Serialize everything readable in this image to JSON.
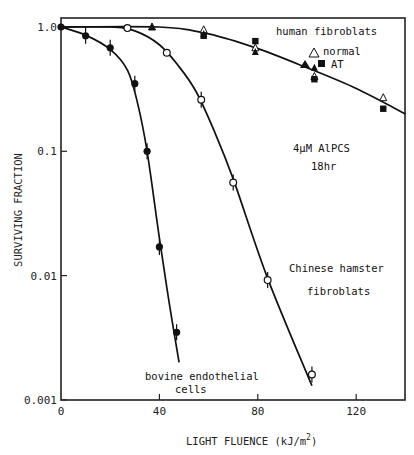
{
  "chart_data": {
    "type": "scatter",
    "title": "",
    "xlabel": "LIGHT FLUENCE (kJ/m2)",
    "xlabel_parts": {
      "main": "LIGHT FLUENCE (kJ/m",
      "sup": "2",
      "end": ")"
    },
    "ylabel": "SURVIVING FRACTION",
    "xlim": [
      0,
      140
    ],
    "ylim": [
      0.001,
      1.15
    ],
    "yscale": "log",
    "grid": false,
    "x_ticks": [
      0,
      40,
      80,
      120
    ],
    "x_tick_labels": [
      "0",
      "40",
      "80",
      "120"
    ],
    "y_ticks": [
      1.0,
      0.1,
      0.01,
      0.001
    ],
    "y_tick_labels": [
      "1.0",
      "0.1",
      "0.01",
      "0.001"
    ],
    "annotations": {
      "human_title": "human fibroblats",
      "normal_label": "normal",
      "at_label": "AT",
      "treatment_line1": "4μM AlPCS",
      "treatment_line2": "18hr",
      "hamster_line1": "Chinese hamster",
      "hamster_line2": "fibroblats",
      "bovine_line1": "bovine endothelial",
      "bovine_line2": "cells"
    },
    "series": [
      {
        "name": "bovine endothelial cells",
        "marker": "filled-circle",
        "x": [
          0,
          10,
          20,
          30,
          35,
          40,
          47
        ],
        "y": [
          1.0,
          0.85,
          0.68,
          0.35,
          0.1,
          0.017,
          0.0035
        ],
        "curve_x": [
          0,
          10,
          20,
          27,
          31,
          35,
          40,
          44,
          48
        ],
        "curve_y": [
          1.0,
          0.86,
          0.66,
          0.45,
          0.25,
          0.1,
          0.02,
          0.006,
          0.002
        ]
      },
      {
        "name": "Chinese hamster fibroblats",
        "marker": "open-circle",
        "x": [
          27,
          43,
          57,
          70,
          84,
          102
        ],
        "y": [
          0.98,
          0.62,
          0.26,
          0.056,
          0.0092,
          0.0016
        ],
        "curve_x": [
          0,
          20,
          30,
          40,
          48,
          55,
          62,
          70,
          84,
          102
        ],
        "curve_y": [
          1.0,
          1.0,
          0.93,
          0.72,
          0.48,
          0.3,
          0.15,
          0.06,
          0.0095,
          0.0013
        ]
      },
      {
        "name": "human fibroblats normal",
        "marker": "open-triangle",
        "x": [
          37,
          58,
          79,
          103,
          131
        ],
        "y": [
          1.0,
          0.95,
          0.68,
          0.4,
          0.27
        ]
      },
      {
        "name": "human fibroblats AT (triangle)",
        "marker": "filled-triangle",
        "x": [
          37,
          58,
          79,
          103
        ],
        "y": [
          1.0,
          0.88,
          0.63,
          0.47
        ]
      },
      {
        "name": "human fibroblats AT (square)",
        "marker": "filled-square",
        "x": [
          58,
          79,
          103,
          131
        ],
        "y": [
          0.85,
          0.77,
          0.38,
          0.22
        ],
        "curve_x": [
          0,
          40,
          60,
          80,
          100,
          120,
          140
        ],
        "curve_y": [
          1.0,
          1.0,
          0.88,
          0.67,
          0.47,
          0.32,
          0.2
        ]
      }
    ]
  }
}
